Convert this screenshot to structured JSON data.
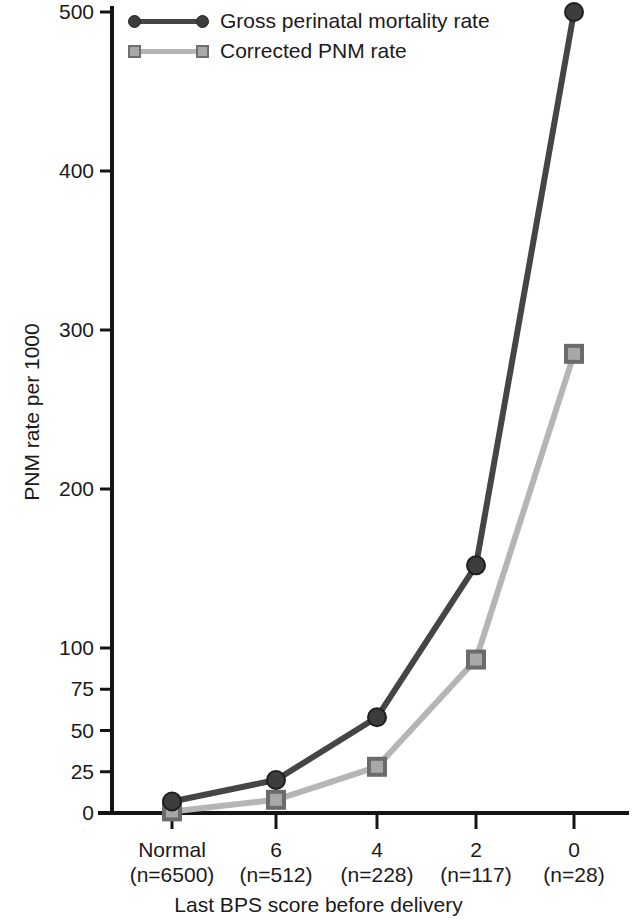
{
  "chart_data": {
    "type": "line",
    "title": "",
    "xlabel": "Last BPS score before delivery",
    "ylabel": "PNM rate per 1000",
    "categories": [
      "Normal",
      "6",
      "4",
      "2",
      "0"
    ],
    "category_counts": [
      "(n=6500)",
      "(n=512)",
      "(n=228)",
      "(n=117)",
      "(n=28)"
    ],
    "ytick_labels": [
      "0",
      "25",
      "50",
      "75",
      "100",
      "200",
      "300",
      "400",
      "500"
    ],
    "ytick_values": [
      0,
      25,
      50,
      75,
      100,
      200,
      300,
      400,
      500
    ],
    "ylim": [
      0,
      500
    ],
    "y_axis_note": "broken/compressed scale: 0-100 compressed, 100-500 linear",
    "grid": false,
    "legend_position": "top-left inside plot",
    "series": [
      {
        "name": "Gross perinatal mortality rate",
        "values": [
          7,
          20,
          58,
          152,
          500
        ],
        "color": "#454545",
        "marker": "circle"
      },
      {
        "name": "Corrected PNM rate",
        "values": [
          1,
          8,
          28,
          93,
          285
        ],
        "color": "#b5b5b5",
        "marker": "square"
      }
    ]
  },
  "legend": {
    "items": [
      {
        "label": "Gross perinatal mortality rate",
        "marker": "circle-marker-icon"
      },
      {
        "label": "Corrected PNM rate",
        "marker": "square-marker-icon"
      }
    ]
  },
  "axes": {
    "y_title": "PNM rate per 1000",
    "x_title": "Last BPS score before delivery"
  }
}
